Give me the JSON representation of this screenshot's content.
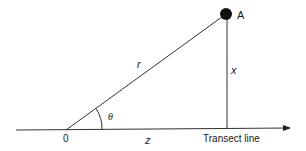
{
  "diagram": {
    "type": "geometry",
    "point": {
      "label": "A",
      "color": "#111111"
    },
    "labels": {
      "hypotenuse": "r",
      "perpendicular": "x",
      "base": "z",
      "angle": "θ",
      "origin": "0",
      "axis": "Transect line"
    },
    "line_color": "#333333"
  }
}
